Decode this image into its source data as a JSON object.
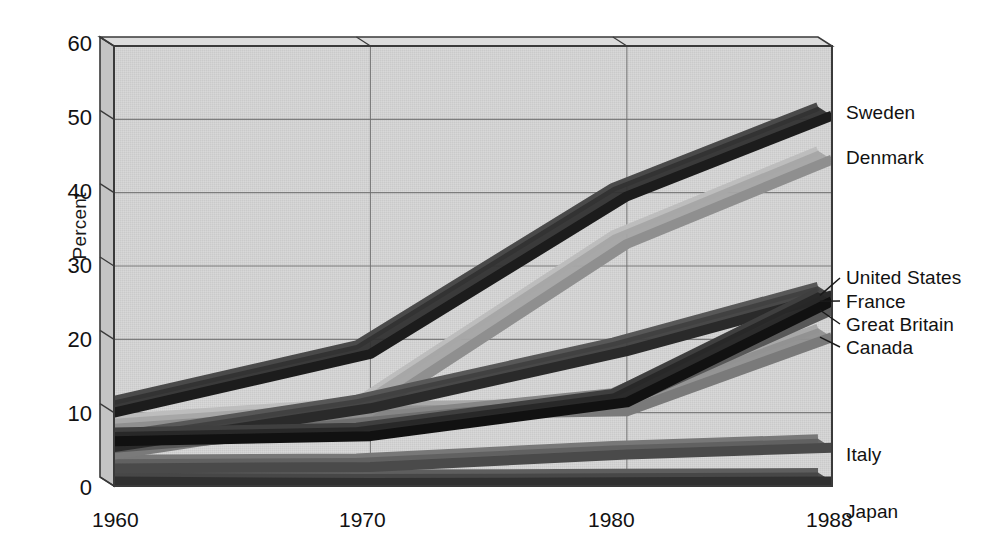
{
  "chart_data": {
    "type": "line",
    "title": "",
    "subtitle": "",
    "xlabel": "",
    "ylabel": "Percent",
    "x": [
      1960,
      1970,
      1980,
      1988
    ],
    "xtick_labels": [
      "1960",
      "1970",
      "1980",
      "1988"
    ],
    "ytick_labels": [
      "0",
      "10",
      "20",
      "30",
      "40",
      "50",
      "60"
    ],
    "yticks": [
      0,
      10,
      20,
      30,
      40,
      50,
      60
    ],
    "ylim": [
      0,
      60
    ],
    "xlim": [
      1960,
      1988
    ],
    "grid": true,
    "legend_position": "right-inline-labels",
    "style": "3d-ribbon-line-chart",
    "series": [
      {
        "name": "Sweden",
        "values": [
          10.0,
          18.0,
          39.5,
          50.5
        ],
        "color": "#1c1c1c"
      },
      {
        "name": "Denmark",
        "values": [
          7.8,
          10.2,
          33.0,
          44.5
        ],
        "color": "#8f8f8f"
      },
      {
        "name": "United States",
        "values": [
          5.3,
          10.6,
          18.4,
          26.0
        ],
        "color": "#2a2a2a"
      },
      {
        "name": "France",
        "values": [
          6.1,
          6.8,
          11.4,
          25.2
        ],
        "color": "#111111"
      },
      {
        "name": "Great Britain",
        "values": [
          5.2,
          8.0,
          11.5,
          24.0
        ],
        "color": "#585858"
      },
      {
        "name": "Canada",
        "values": [
          4.3,
          9.6,
          10.2,
          20.3
        ],
        "color": "#7a7a7a"
      },
      {
        "name": "Italy",
        "values": [
          2.4,
          2.6,
          4.3,
          5.2
        ],
        "color": "#4a4a4a"
      },
      {
        "name": "Japan",
        "values": [
          0.6,
          0.4,
          0.5,
          0.6
        ],
        "color": "#303030"
      }
    ],
    "series_labels": [
      {
        "name": "Sweden",
        "label": "Sweden",
        "leader": false
      },
      {
        "name": "Denmark",
        "label": "Denmark",
        "leader": false
      },
      {
        "name": "United States",
        "label": "United States",
        "leader": true
      },
      {
        "name": "France",
        "label": "France",
        "leader": true
      },
      {
        "name": "Great Britain",
        "label": "Great Britain",
        "leader": true
      },
      {
        "name": "Canada",
        "label": "Canada",
        "leader": true
      },
      {
        "name": "Italy",
        "label": "Italy",
        "leader": false
      },
      {
        "name": "Japan",
        "label": "Japan",
        "leader": false
      }
    ],
    "colors": {
      "plot_background": "#d2d2d2",
      "panel_side": "#c4c4c4",
      "panel_top": "#dcdcdc",
      "gridline": "#6e6e6e",
      "frame": "#3a3a3a",
      "page_background": "#ffffff",
      "text": "#121212"
    }
  }
}
